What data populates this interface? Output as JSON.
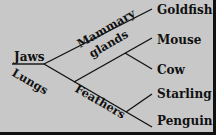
{
  "diagram": {
    "type": "cladogram",
    "background_color": "#c8c8c8",
    "line_color": "#111111",
    "root_trait": "Jaws",
    "traits": [
      "Lungs",
      "Mammary glands",
      "Feathers"
    ],
    "trait_labels": {
      "jaws": "Jaws",
      "lungs": "Lungs",
      "mammary_line1": "Mammary",
      "mammary_line2": "glands",
      "feathers": "Feathers"
    },
    "taxa": [
      "Goldfish",
      "Mouse",
      "Cow",
      "Starling",
      "Penguin"
    ],
    "taxa_labels": {
      "goldfish": "Goldfish",
      "mouse": "Mouse",
      "cow": "Cow",
      "starling": "Starling",
      "penguin": "Penguin"
    }
  }
}
